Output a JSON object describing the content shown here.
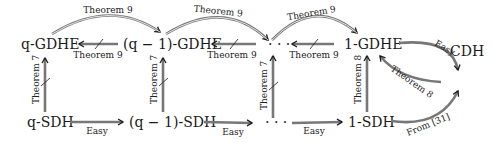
{
  "nodes": {
    "q_gdhe": "q-GDHE",
    "qm1_gdhe": "(q − 1)-GDHE",
    "dots_top": "· · ·",
    "one_gdhe": "1-GDHE",
    "cdh": "CDH",
    "q_sdh": "q-SDH",
    "qm1_sdh": "(q − 1)-SDH",
    "dots_bottom": "· · ·",
    "one_sdh": "1-SDH"
  },
  "edges": {
    "top_arc_1": "Theorem 9",
    "top_arc_2": "Theorem 9",
    "top_arc_3": "Theorem 9",
    "back_1": "Theorem 9",
    "back_2": "Theorem 9",
    "back_3": "Theorem 9",
    "vert_1": "Theorem 7",
    "vert_2": "Theorem 7",
    "vert_3": "Theorem 7",
    "vert_4": "Theorem 8",
    "easy_1": "Easy",
    "easy_2": "Easy",
    "easy_3": "Easy",
    "gdhe_to_cdh": "Easy",
    "cdh_to_gdhe": "Theorem 8",
    "sdh_to_cdh": "From [31]"
  }
}
